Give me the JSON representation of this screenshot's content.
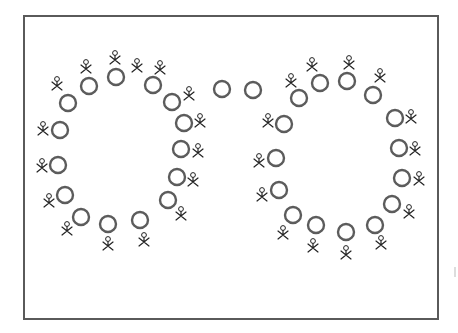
{
  "diagram": {
    "title": "",
    "frame": {
      "x": 24,
      "y": 16,
      "width": 414,
      "height": 303
    },
    "colors": {
      "seat_stroke": "#5c5c5c",
      "person": "#222222",
      "frame": "#5a5a5a",
      "background": "#ffffff"
    },
    "seat_radius": 8,
    "groups": [
      {
        "name": "left-ring",
        "seats": [
          {
            "x": 68,
            "y": 103
          },
          {
            "x": 89,
            "y": 86
          },
          {
            "x": 116,
            "y": 77
          },
          {
            "x": 153,
            "y": 85
          },
          {
            "x": 172,
            "y": 102
          },
          {
            "x": 184,
            "y": 123
          },
          {
            "x": 181,
            "y": 149
          },
          {
            "x": 177,
            "y": 177
          },
          {
            "x": 168,
            "y": 200
          },
          {
            "x": 140,
            "y": 220
          },
          {
            "x": 108,
            "y": 224
          },
          {
            "x": 81,
            "y": 217
          },
          {
            "x": 65,
            "y": 195
          },
          {
            "x": 58,
            "y": 165
          },
          {
            "x": 60,
            "y": 130
          }
        ],
        "people": [
          {
            "x": 57,
            "y": 83
          },
          {
            "x": 86,
            "y": 66
          },
          {
            "x": 115,
            "y": 57
          },
          {
            "x": 137,
            "y": 65
          },
          {
            "x": 160,
            "y": 67
          },
          {
            "x": 189,
            "y": 93
          },
          {
            "x": 200,
            "y": 120
          },
          {
            "x": 198,
            "y": 150
          },
          {
            "x": 193,
            "y": 179
          },
          {
            "x": 181,
            "y": 213
          },
          {
            "x": 144,
            "y": 239
          },
          {
            "x": 108,
            "y": 243
          },
          {
            "x": 67,
            "y": 228
          },
          {
            "x": 49,
            "y": 200
          },
          {
            "x": 42,
            "y": 165
          },
          {
            "x": 43,
            "y": 128
          }
        ]
      },
      {
        "name": "connector",
        "seats": [
          {
            "x": 222,
            "y": 89
          },
          {
            "x": 253,
            "y": 90
          }
        ],
        "people": []
      },
      {
        "name": "right-ring",
        "seats": [
          {
            "x": 299,
            "y": 98
          },
          {
            "x": 320,
            "y": 83
          },
          {
            "x": 347,
            "y": 81
          },
          {
            "x": 373,
            "y": 95
          },
          {
            "x": 395,
            "y": 118
          },
          {
            "x": 399,
            "y": 148
          },
          {
            "x": 402,
            "y": 178
          },
          {
            "x": 392,
            "y": 204
          },
          {
            "x": 375,
            "y": 225
          },
          {
            "x": 346,
            "y": 232
          },
          {
            "x": 316,
            "y": 225
          },
          {
            "x": 293,
            "y": 215
          },
          {
            "x": 279,
            "y": 190
          },
          {
            "x": 276,
            "y": 158
          },
          {
            "x": 284,
            "y": 124
          }
        ],
        "people": [
          {
            "x": 291,
            "y": 80
          },
          {
            "x": 312,
            "y": 64
          },
          {
            "x": 349,
            "y": 62
          },
          {
            "x": 380,
            "y": 75
          },
          {
            "x": 411,
            "y": 116
          },
          {
            "x": 415,
            "y": 148
          },
          {
            "x": 419,
            "y": 178
          },
          {
            "x": 409,
            "y": 211
          },
          {
            "x": 381,
            "y": 242
          },
          {
            "x": 346,
            "y": 252
          },
          {
            "x": 313,
            "y": 245
          },
          {
            "x": 283,
            "y": 232
          },
          {
            "x": 262,
            "y": 194
          },
          {
            "x": 259,
            "y": 160
          },
          {
            "x": 268,
            "y": 120
          }
        ]
      }
    ],
    "counts": {
      "total_seats": 32,
      "total_people": 31
    },
    "edge_mark": {
      "x": 455,
      "y": 272
    }
  }
}
